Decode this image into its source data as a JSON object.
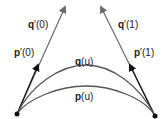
{
  "diagram": {
    "labels": {
      "q0_vec": "q",
      "q0_arg": "′(0)",
      "p0_vec": "p",
      "p0_arg": "′(0)",
      "q1_vec": "q",
      "q1_arg": "′(1)",
      "p1_vec": "p",
      "p1_arg": "′(1)",
      "qu_vec": "q",
      "qu_arg": "(u)",
      "pu_vec": "p",
      "pu_arg": "(u)"
    },
    "colors": {
      "dark": "#111111",
      "gray": "#6b6b6b",
      "curve": "#4a4a4a"
    }
  }
}
